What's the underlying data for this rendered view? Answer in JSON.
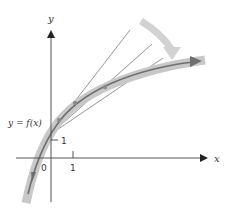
{
  "diagram": {
    "type": "tangent-lines-approaching-curve",
    "axes": {
      "x_label": "x",
      "y_label": "y",
      "origin_label": "0",
      "x_tick_label": "1",
      "y_tick_label": "1"
    },
    "curve_label": "y = f(x)",
    "tangent_line_count": 3,
    "colors": {
      "axis": "#555555",
      "curve_band": "#c8c8c8",
      "curve_line": "#6e6e6e",
      "tangent": "#8a8a8a",
      "motion_arrow": "#d0d0d0",
      "point": "#8c8c8c"
    }
  }
}
